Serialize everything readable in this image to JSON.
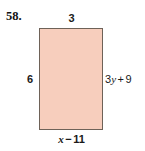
{
  "problem": {
    "number": "58."
  },
  "figure": {
    "shape": "rectangle",
    "fill_color": "#f7cebd",
    "stroke_color": "#6e6258",
    "background_color": "#ffffff",
    "labels": {
      "top": "3",
      "left": "6",
      "right": "3y + 9",
      "bottom": "x - 11"
    },
    "right_parts": {
      "coefficient": "3",
      "variable": "y",
      "operator": "+",
      "constant": "9"
    },
    "bottom_parts": {
      "variable": "x",
      "operator": "−",
      "constant": "11"
    }
  }
}
